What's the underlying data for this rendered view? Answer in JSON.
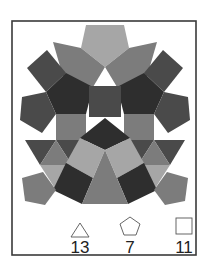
{
  "figure": {
    "frame": {
      "x": 12,
      "y": 21,
      "width": 184,
      "height": 234
    },
    "colors": {
      "frame_stroke": "#3a3a3a",
      "light": "#a6a6a6",
      "mid": "#7c7c7c",
      "dark": "#4a4a4a",
      "darkest": "#2e2e2e"
    },
    "shapes": [
      {
        "type": "pentagon",
        "color": "light",
        "points": "86,25 124,25 129,48 105,67 81,48"
      },
      {
        "type": "square",
        "color": "mid",
        "points": "53,42 81,48 105,67 93,87 64,80"
      },
      {
        "type": "square",
        "color": "mid",
        "points": "157,42 129,48 105,67 117,87 146,80"
      },
      {
        "type": "square",
        "color": "dark",
        "points": "27,68 47,50 66,73 46,92"
      },
      {
        "type": "square",
        "color": "dark",
        "points": "183,68 163,50 144,73 164,92"
      },
      {
        "type": "pentagon",
        "color": "darkest",
        "points": "66,73 93,87 86,114 56,114 46,92"
      },
      {
        "type": "pentagon",
        "color": "darkest",
        "points": "144,73 117,87 124,114 154,114 164,92"
      },
      {
        "type": "pentagon",
        "color": "dark",
        "points": "22,97 46,92 56,114 42,133 20,120"
      },
      {
        "type": "pentagon",
        "color": "dark",
        "points": "188,97 164,92 154,114 168,133 190,120"
      },
      {
        "type": "square",
        "color": "dark",
        "points": "89,86 121,86 121,117 89,117"
      },
      {
        "type": "square",
        "color": "mid",
        "points": "56,114 86,114 86,140 56,140"
      },
      {
        "type": "square",
        "color": "mid",
        "points": "124,114 154,114 154,140 124,140"
      },
      {
        "type": "triangle",
        "color": "darkest",
        "points": "105,118 130,138 105,150"
      },
      {
        "type": "triangle",
        "color": "darkest",
        "points": "105,118 80,138 105,150"
      },
      {
        "type": "triangle",
        "color": "dark",
        "points": "25,140 56,140 40,165"
      },
      {
        "type": "triangle",
        "color": "dark",
        "points": "56,140 86,140 72,165"
      },
      {
        "type": "triangle",
        "color": "mid",
        "points": "56,140 72,165 40,165"
      },
      {
        "type": "triangle",
        "color": "dark",
        "points": "185,140 154,140 170,165"
      },
      {
        "type": "triangle",
        "color": "dark",
        "points": "154,140 124,140 138,165"
      },
      {
        "type": "triangle",
        "color": "mid",
        "points": "154,140 138,165 170,165"
      },
      {
        "type": "square",
        "color": "light",
        "points": "80,138 105,150 93,178 66,163"
      },
      {
        "type": "square",
        "color": "light",
        "points": "130,138 105,150 117,178 144,163"
      },
      {
        "type": "triangle",
        "color": "light",
        "points": "40,165 72,165 56,190"
      },
      {
        "type": "triangle",
        "color": "light",
        "points": "170,165 138,165 154,190"
      },
      {
        "type": "square",
        "color": "darkest",
        "points": "66,163 93,178 82,204 53,190"
      },
      {
        "type": "square",
        "color": "darkest",
        "points": "144,163 117,178 128,204 157,190"
      },
      {
        "type": "triangle",
        "color": "mid",
        "points": "105,150 128,204 82,204"
      },
      {
        "type": "pentagon",
        "color": "mid",
        "points": "22,178 43,172 56,190 45,205 25,201"
      },
      {
        "type": "pentagon",
        "color": "mid",
        "points": "188,178 167,172 154,190 165,205 185,201"
      }
    ]
  },
  "legend": {
    "items": [
      {
        "shape": "triangle",
        "icon": "triangle-icon",
        "count": "13"
      },
      {
        "shape": "pentagon",
        "icon": "pentagon-icon",
        "count": "7"
      },
      {
        "shape": "square",
        "icon": "square-icon",
        "count": "11"
      }
    ]
  }
}
